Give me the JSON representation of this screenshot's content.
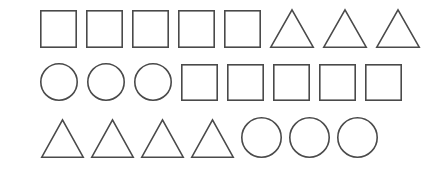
{
  "canvas": {
    "width": 422,
    "height": 174,
    "background_color": "#ffffff",
    "stroke_color": "#4a4a4a",
    "fill_color": "none",
    "stroke_width": 1.6
  },
  "figure": {
    "row_count": 3,
    "total_shape_count": 23
  },
  "rows": [
    {
      "id": "row-1",
      "label": "Row 1",
      "top": 9,
      "left": 40,
      "gap": 9,
      "shape_count": 8,
      "summary": "5 squares then 3 triangles",
      "shapes": [
        {
          "type": "square",
          "index": 1,
          "width": 37,
          "height": 38,
          "label": "Square"
        },
        {
          "type": "square",
          "index": 2,
          "width": 37,
          "height": 38,
          "label": "Square"
        },
        {
          "type": "square",
          "index": 3,
          "width": 37,
          "height": 38,
          "label": "Square"
        },
        {
          "type": "square",
          "index": 4,
          "width": 37,
          "height": 38,
          "label": "Square"
        },
        {
          "type": "square",
          "index": 5,
          "width": 37,
          "height": 38,
          "label": "Square"
        },
        {
          "type": "triangle",
          "index": 6,
          "width": 44,
          "height": 39,
          "label": "Triangle"
        },
        {
          "type": "triangle",
          "index": 7,
          "width": 44,
          "height": 39,
          "label": "Triangle"
        },
        {
          "type": "triangle",
          "index": 8,
          "width": 44,
          "height": 39,
          "label": "Triangle"
        }
      ]
    },
    {
      "id": "row-2",
      "label": "Row 2",
      "top": 63,
      "left": 40,
      "gap": 9,
      "shape_count": 8,
      "summary": "3 circles then 5 squares",
      "shapes": [
        {
          "type": "circle",
          "index": 1,
          "width": 38,
          "height": 38,
          "label": "Circle"
        },
        {
          "type": "circle",
          "index": 2,
          "width": 38,
          "height": 38,
          "label": "Circle"
        },
        {
          "type": "circle",
          "index": 3,
          "width": 38,
          "height": 38,
          "label": "Circle"
        },
        {
          "type": "square",
          "index": 4,
          "width": 37,
          "height": 37,
          "label": "Square"
        },
        {
          "type": "square",
          "index": 5,
          "width": 37,
          "height": 37,
          "label": "Square"
        },
        {
          "type": "square",
          "index": 6,
          "width": 37,
          "height": 37,
          "label": "Square"
        },
        {
          "type": "square",
          "index": 7,
          "width": 37,
          "height": 37,
          "label": "Square"
        },
        {
          "type": "square",
          "index": 8,
          "width": 37,
          "height": 37,
          "label": "Square"
        }
      ]
    },
    {
      "id": "row-3",
      "label": "Row 3",
      "top": 117,
      "left": 41,
      "gap": 7,
      "shape_count": 7,
      "summary": "4 triangles then 3 circles",
      "shapes": [
        {
          "type": "triangle",
          "index": 1,
          "width": 43,
          "height": 39,
          "label": "Triangle"
        },
        {
          "type": "triangle",
          "index": 2,
          "width": 43,
          "height": 39,
          "label": "Triangle"
        },
        {
          "type": "triangle",
          "index": 3,
          "width": 43,
          "height": 39,
          "label": "Triangle"
        },
        {
          "type": "triangle",
          "index": 4,
          "width": 43,
          "height": 39,
          "label": "Triangle"
        },
        {
          "type": "circle",
          "index": 5,
          "width": 41,
          "height": 41,
          "label": "Circle"
        },
        {
          "type": "circle",
          "index": 6,
          "width": 41,
          "height": 41,
          "label": "Circle"
        },
        {
          "type": "circle",
          "index": 7,
          "width": 41,
          "height": 41,
          "label": "Circle"
        }
      ]
    }
  ]
}
